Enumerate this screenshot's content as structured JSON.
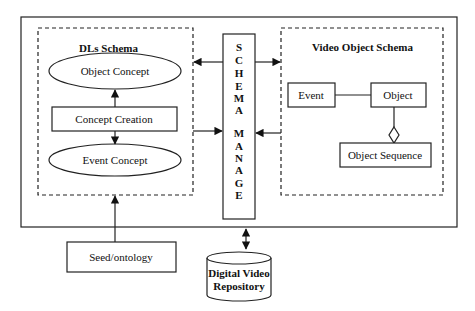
{
  "diagram": {
    "outer_frame": {
      "label": ""
    },
    "dls_schema": {
      "title": "DLs Schema",
      "object_concept": "Object Concept",
      "concept_creation": "Concept Creation",
      "event_concept": "Event Concept"
    },
    "schema_manage": {
      "letters": [
        "S",
        "C",
        "H",
        "E",
        "M",
        "A",
        "",
        "M",
        "A",
        "N",
        "A",
        "G",
        "E"
      ],
      "label": "SCHEMA MANAGE"
    },
    "video_object_schema": {
      "title": "Video Object Schema",
      "event": "Event",
      "object": "Object",
      "object_sequence": "Object Sequence"
    },
    "seed_ontology": "Seed/ontology",
    "repository": {
      "line1": "Digital Video",
      "line2": "Repository"
    }
  }
}
